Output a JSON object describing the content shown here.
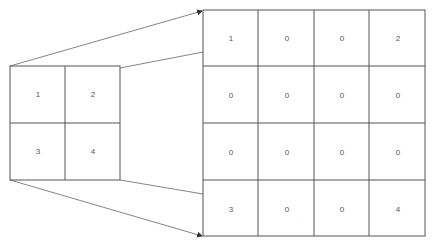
{
  "diagram": {
    "type": "matrix-expansion",
    "line_color": "#555555",
    "source_matrix": {
      "rows": 2,
      "cols": 2,
      "values": [
        [
          "1",
          "2"
        ],
        [
          "3",
          "4"
        ]
      ]
    },
    "target_matrix": {
      "rows": 4,
      "cols": 4,
      "values": [
        [
          "1",
          "0",
          "0",
          "2"
        ],
        [
          "0",
          "0",
          "0",
          "0"
        ],
        [
          "0",
          "0",
          "0",
          "0"
        ],
        [
          "3",
          "0",
          "0",
          "4"
        ]
      ]
    }
  }
}
